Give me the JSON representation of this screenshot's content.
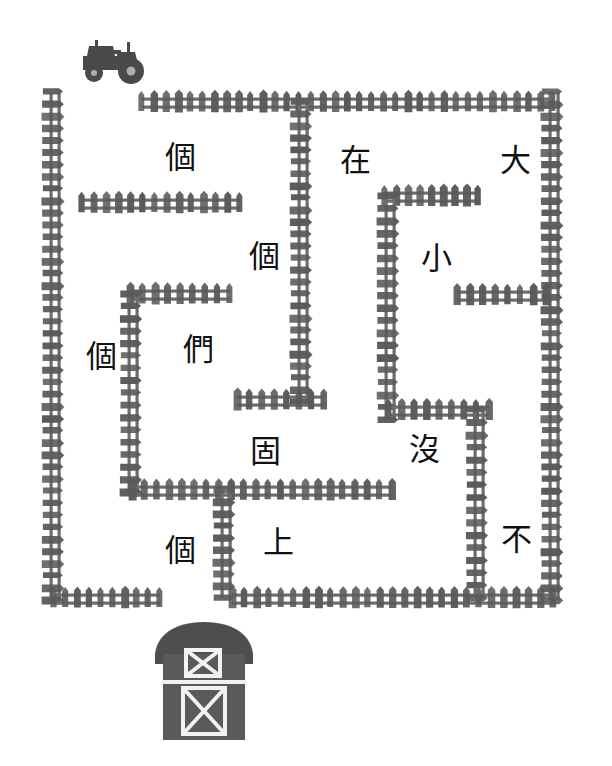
{
  "puzzle": {
    "type": "chinese-character-maze-worksheet",
    "background_color": "#ffffff",
    "fence_color": "#5a5a5a",
    "fence_color_light": "#6d6d6d",
    "ink_color": "#111111",
    "tractor_color": "#4a4a4a",
    "barn_color": "#5a5a5a",
    "barn_roof_color": "#4e4e4e",
    "barn_trim_color": "#f2f2f2"
  },
  "start_marker": {
    "name": "tractor",
    "icon": "tractor-icon",
    "x": 113,
    "y": 62
  },
  "end_marker": {
    "name": "barn",
    "icon": "barn-icon",
    "x": 204,
    "y": 680
  },
  "characters": [
    {
      "id": "c1",
      "text": "個",
      "x": 180,
      "y": 157
    },
    {
      "id": "c2",
      "text": "在",
      "x": 355,
      "y": 160
    },
    {
      "id": "c3",
      "text": "大",
      "x": 515,
      "y": 160
    },
    {
      "id": "c4",
      "text": "個",
      "x": 264,
      "y": 256
    },
    {
      "id": "c5",
      "text": "小",
      "x": 436,
      "y": 258
    },
    {
      "id": "c6",
      "text": "個",
      "x": 101,
      "y": 356
    },
    {
      "id": "c7",
      "text": "們",
      "x": 198,
      "y": 349
    },
    {
      "id": "c8",
      "text": "固",
      "x": 265,
      "y": 451
    },
    {
      "id": "c9",
      "text": "沒",
      "x": 424,
      "y": 449
    },
    {
      "id": "c10",
      "text": "不",
      "x": 516,
      "y": 539
    },
    {
      "id": "c11",
      "text": "個",
      "x": 180,
      "y": 550
    },
    {
      "id": "c12",
      "text": "上",
      "x": 278,
      "y": 542
    }
  ],
  "fences": [
    {
      "id": "f-top-main",
      "orient": "h",
      "x1": 142,
      "x2": 553,
      "y": 102
    },
    {
      "id": "f-left-outer",
      "orient": "v",
      "y1": 92,
      "y2": 600,
      "x": 54
    },
    {
      "id": "f-right-outer",
      "orient": "v",
      "y1": 92,
      "y2": 600,
      "x": 553
    },
    {
      "id": "f-bottom-left",
      "orient": "h",
      "x1": 54,
      "x2": 160,
      "y": 598
    },
    {
      "id": "f-bottom-right",
      "orient": "h",
      "x1": 232,
      "x2": 553,
      "y": 598
    },
    {
      "id": "f-inner-top-left",
      "orient": "h",
      "x1": 82,
      "x2": 240,
      "y": 203
    },
    {
      "id": "f-inner-vert-mid",
      "orient": "v",
      "y1": 102,
      "y2": 402,
      "x": 302
    },
    {
      "id": "f-inner-h-mid",
      "orient": "h",
      "x1": 237,
      "x2": 324,
      "y": 400
    },
    {
      "id": "f-inner-h-small",
      "orient": "h",
      "x1": 130,
      "x2": 230,
      "y": 294
    },
    {
      "id": "f-inner-vert-l2",
      "orient": "v",
      "y1": 294,
      "y2": 492,
      "x": 132
    },
    {
      "id": "f-inner-h-low",
      "orient": "h",
      "x1": 132,
      "x2": 392,
      "y": 490
    },
    {
      "id": "f-inner-vert-l3",
      "orient": "v",
      "y1": 490,
      "y2": 598,
      "x": 225
    },
    {
      "id": "f-right-box-top",
      "orient": "h",
      "x1": 385,
      "x2": 478,
      "y": 196
    },
    {
      "id": "f-right-box-left",
      "orient": "v",
      "y1": 196,
      "y2": 420,
      "x": 389
    },
    {
      "id": "f-right-h-mid",
      "orient": "h",
      "x1": 457,
      "x2": 546,
      "y": 295
    },
    {
      "id": "f-right-h-low",
      "orient": "h",
      "x1": 389,
      "x2": 489,
      "y": 410
    },
    {
      "id": "f-right-vert-low",
      "orient": "v",
      "y1": 410,
      "y2": 598,
      "x": 478
    }
  ]
}
